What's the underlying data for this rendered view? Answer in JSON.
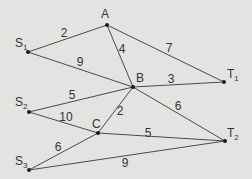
{
  "diagram": {
    "type": "weighted-graph",
    "nodes": [
      {
        "id": "A",
        "label": "A",
        "sub": "",
        "x": 107,
        "y": 25,
        "lx": 101,
        "ly": 18
      },
      {
        "id": "S1",
        "label": "S",
        "sub": "1",
        "x": 28,
        "y": 52,
        "lx": 15,
        "ly": 47
      },
      {
        "id": "B",
        "label": "B",
        "sub": "",
        "x": 133,
        "y": 87,
        "lx": 136,
        "ly": 82
      },
      {
        "id": "T1",
        "label": "T",
        "sub": "1",
        "x": 224,
        "y": 82,
        "lx": 227,
        "ly": 78
      },
      {
        "id": "S2",
        "label": "S",
        "sub": "2",
        "x": 29,
        "y": 112,
        "lx": 15,
        "ly": 106
      },
      {
        "id": "C",
        "label": "C",
        "sub": "",
        "x": 98,
        "y": 133,
        "lx": 92,
        "ly": 128
      },
      {
        "id": "S3",
        "label": "S",
        "sub": "3",
        "x": 29,
        "y": 170,
        "lx": 15,
        "ly": 165
      },
      {
        "id": "T2",
        "label": "T",
        "sub": "2",
        "x": 225,
        "y": 141,
        "lx": 227,
        "ly": 137
      }
    ],
    "edges": [
      {
        "from": "S1",
        "to": "A",
        "weight": "2",
        "wx": 64,
        "wy": 37
      },
      {
        "from": "S1",
        "to": "B",
        "weight": "9",
        "wx": 80,
        "wy": 66
      },
      {
        "from": "A",
        "to": "B",
        "weight": "4",
        "wx": 122,
        "wy": 53
      },
      {
        "from": "A",
        "to": "T1",
        "weight": "7",
        "wx": 169,
        "wy": 52
      },
      {
        "from": "B",
        "to": "T1",
        "weight": "3",
        "wx": 171,
        "wy": 83
      },
      {
        "from": "S2",
        "to": "B",
        "weight": "5",
        "wx": 72,
        "wy": 99
      },
      {
        "from": "S2",
        "to": "C",
        "weight": "10",
        "wx": 66,
        "wy": 121
      },
      {
        "from": "B",
        "to": "C",
        "weight": "2",
        "wx": 120,
        "wy": 115
      },
      {
        "from": "B",
        "to": "T2",
        "weight": "6",
        "wx": 178,
        "wy": 110
      },
      {
        "from": "C",
        "to": "T2",
        "weight": "5",
        "wx": 148,
        "wy": 137
      },
      {
        "from": "S3",
        "to": "C",
        "weight": "6",
        "wx": 58,
        "wy": 151
      },
      {
        "from": "S3",
        "to": "T2",
        "weight": "9",
        "wx": 125,
        "wy": 167
      }
    ]
  }
}
